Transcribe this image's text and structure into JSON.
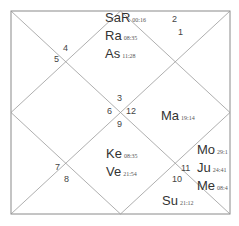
{
  "chart": {
    "style": "North Indian",
    "houses": [
      {
        "num": "1",
        "x": 178,
        "y": 27
      },
      {
        "num": "2",
        "x": 172,
        "y": 14
      },
      {
        "num": "3",
        "x": 117,
        "y": 93
      },
      {
        "num": "4",
        "x": 63,
        "y": 43
      },
      {
        "num": "5",
        "x": 54,
        "y": 54
      },
      {
        "num": "6",
        "x": 107,
        "y": 106
      },
      {
        "num": "9",
        "x": 117,
        "y": 119
      },
      {
        "num": "12",
        "x": 126,
        "y": 106
      },
      {
        "num": "7",
        "x": 55,
        "y": 162
      },
      {
        "num": "8",
        "x": 64,
        "y": 174
      },
      {
        "num": "10",
        "x": 172,
        "y": 174
      },
      {
        "num": "11",
        "x": 181,
        "y": 163
      }
    ],
    "planet_groups": [
      {
        "id": "house-1",
        "x": 105,
        "y": 10,
        "planets": [
          {
            "name": "SaR",
            "degree": "00:16"
          },
          {
            "name": "Ra",
            "degree": "08:35"
          },
          {
            "name": "As",
            "degree": "11:28"
          }
        ]
      },
      {
        "id": "house-12",
        "x": 161,
        "y": 108,
        "planets": [
          {
            "name": "Ma",
            "degree": "19:14"
          }
        ]
      },
      {
        "id": "house-9",
        "x": 106,
        "y": 146,
        "planets": [
          {
            "name": "Ke",
            "degree": "08:35"
          },
          {
            "name": "Ve",
            "degree": "21:54"
          }
        ]
      },
      {
        "id": "house-11",
        "x": 197,
        "y": 142,
        "planets": [
          {
            "name": "Mo",
            "degree": "29:1"
          },
          {
            "name": "Ju",
            "degree": "24:41"
          },
          {
            "name": "Me",
            "degree": "08:4"
          }
        ]
      },
      {
        "id": "house-10",
        "x": 162,
        "y": 193,
        "planets": [
          {
            "name": "Su",
            "degree": "21:12"
          }
        ]
      }
    ],
    "colors": {
      "line": "#9a9a9a",
      "frame": "#8a8a8a",
      "text": "#333333"
    }
  }
}
